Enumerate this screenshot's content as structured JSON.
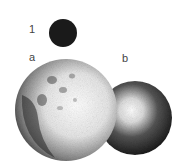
{
  "figure": {
    "labels": {
      "one": "1",
      "a": "a",
      "b": "b"
    },
    "objects": [
      {
        "name": "small-dark-sphere",
        "label": "1",
        "color": "#1a1a1a"
      },
      {
        "name": "cratered-sphere",
        "label": "a",
        "color": "#f2f2f2"
      },
      {
        "name": "smooth-shaded-sphere",
        "label": "b",
        "color": "#2a2a2a"
      }
    ]
  }
}
